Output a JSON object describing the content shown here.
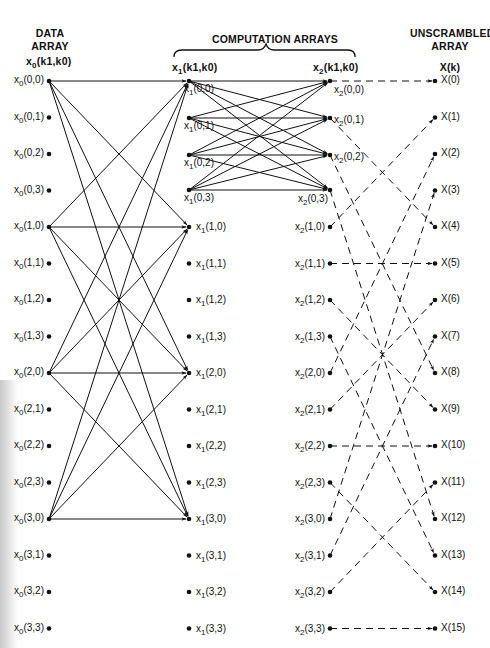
{
  "headers": {
    "data_array": "DATA\nARRAY",
    "data_array_line1": "DATA",
    "data_array_line2": "ARRAY",
    "computation_arrays": "COMPUTATION ARRAYS",
    "unscrambled_line1": "UNSCRAMBLED",
    "unscrambled_line2": "ARRAY",
    "col0_var": "x",
    "col0_sub": "0",
    "col0_args": "(k",
    "col1_var": "x",
    "col1_sub": "1",
    "col2_var": "x",
    "col2_sub": "2",
    "col_args_text": "(k1,k0)",
    "output_var": "X(k)"
  },
  "columns": {
    "col0": {
      "var": "x",
      "sub": "0",
      "indices": [
        "(0,0)",
        "(0,1)",
        "(0,2)",
        "(0,3)",
        "(1,0)",
        "(1,1)",
        "(1,2)",
        "(1,3)",
        "(2,0)",
        "(2,1)",
        "(2,2)",
        "(2,3)",
        "(3,0)",
        "(3,1)",
        "(3,2)",
        "(3,3)"
      ]
    },
    "col1": {
      "var": "x",
      "sub": "1",
      "indices": [
        "(0,0)",
        "(0,1)",
        "(0,2)",
        "(0,3)",
        "(1,0)",
        "(1,1)",
        "(1,2)",
        "(1,3)",
        "(2,0)",
        "(2,1)",
        "(2,2)",
        "(2,3)",
        "(3,0)",
        "(3,1)",
        "(3,2)",
        "(3,3)"
      ]
    },
    "col2": {
      "var": "x",
      "sub": "2",
      "indices": [
        "(0,0)",
        "(0,1)",
        "(0,2)",
        "(0,3)",
        "(1,0)",
        "(1,1)",
        "(1,2)",
        "(1,3)",
        "(2,0)",
        "(2,1)",
        "(2,2)",
        "(2,3)",
        "(3,0)",
        "(3,1)",
        "(3,2)",
        "(3,3)"
      ]
    },
    "output": {
      "labels": [
        "X(0)",
        "X(1)",
        "X(2)",
        "X(3)",
        "X(4)",
        "X(5)",
        "X(6)",
        "X(7)",
        "X(8)",
        "X(9)",
        "X(10)",
        "X(11)",
        "X(12)",
        "X(13)",
        "X(14)",
        "X(15)"
      ]
    }
  },
  "flow": {
    "stage1_sources": [
      0,
      4,
      8,
      12
    ],
    "stage1_targets": [
      0,
      4,
      8,
      12
    ],
    "stage2_sources": [
      0,
      1,
      2,
      3
    ],
    "stage2_targets": [
      0,
      1,
      2,
      3
    ],
    "unscramble_map": [
      0,
      4,
      8,
      12,
      1,
      5,
      9,
      13,
      2,
      6,
      10,
      14,
      3,
      7,
      11,
      15
    ]
  },
  "colors": {
    "ink": "#111111",
    "background": "#ffffff"
  }
}
